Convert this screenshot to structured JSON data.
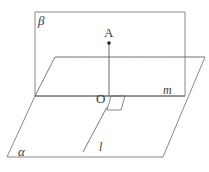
{
  "figure": {
    "background_color": "#ffffff",
    "stroke_color": "#555555",
    "label_color": "#3a3a3a",
    "width": 209,
    "height": 172
  },
  "labels": {
    "plane_beta": "β",
    "plane_alpha": "α",
    "point_A": "A",
    "point_O": "O",
    "line_m": "m",
    "line_l": "l"
  },
  "geometry": {
    "plane_beta_vertices": "100,12 185,12 185,96 35,96 35,12",
    "plane_alpha_vertices": "35,96 55,57 205,57 163,157 7,157",
    "hidden_edges": "35,96 55,57 205,57",
    "intersection_line": "35,96 185,96",
    "segment_AO": "109,43 109,96",
    "line_l": "105,110 83,152",
    "point_A_marker": {
      "cx": 109,
      "cy": 43,
      "r": 1.8
    },
    "right_angle_marker": "111,96 125,96 121,110 107,110"
  }
}
